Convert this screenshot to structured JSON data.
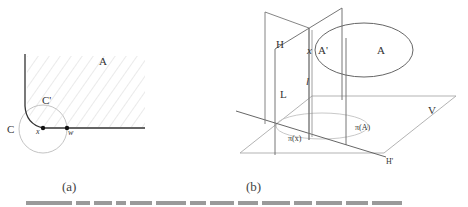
{
  "figure": {
    "panel_a": {
      "caption": "(a)",
      "labels": {
        "region": "A",
        "circle_outer": "C",
        "circle_inner": "C'",
        "point_x": "x",
        "point_w": "w"
      }
    },
    "panel_b": {
      "caption": "(b)",
      "labels": {
        "plane_h": "H",
        "plane_l": "L",
        "plane_v": "V",
        "line_h_prime": "H'",
        "region_a": "A",
        "region_a_prime": "A'",
        "point_x": "x",
        "line_l": "l",
        "projection_a": "π(A)",
        "projection_x": "π(x)"
      }
    },
    "colors": {
      "line_dark": "#333333",
      "line_light": "#bbbbbb",
      "hatch": "#d9d9d9",
      "background": "#ffffff"
    }
  }
}
